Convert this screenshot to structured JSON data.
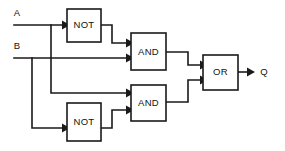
{
  "diagram": {
    "background_color": "#ffffff",
    "line_color": "#1a1a1a",
    "text_color": "#111111"
  },
  "inputs": [
    {
      "id": "input-a",
      "label": "A"
    },
    {
      "id": "input-b",
      "label": "B"
    }
  ],
  "outputs": [
    {
      "id": "output-q",
      "label": "Q"
    }
  ],
  "gates": [
    {
      "id": "not-gate-top",
      "label": "NOT",
      "type": "NOT"
    },
    {
      "id": "and-gate-top",
      "label": "AND",
      "type": "AND"
    },
    {
      "id": "and-gate-bottom",
      "label": "AND",
      "type": "AND"
    },
    {
      "id": "not-gate-bottom",
      "label": "NOT",
      "type": "NOT"
    },
    {
      "id": "or-gate",
      "label": "OR",
      "type": "OR"
    }
  ]
}
